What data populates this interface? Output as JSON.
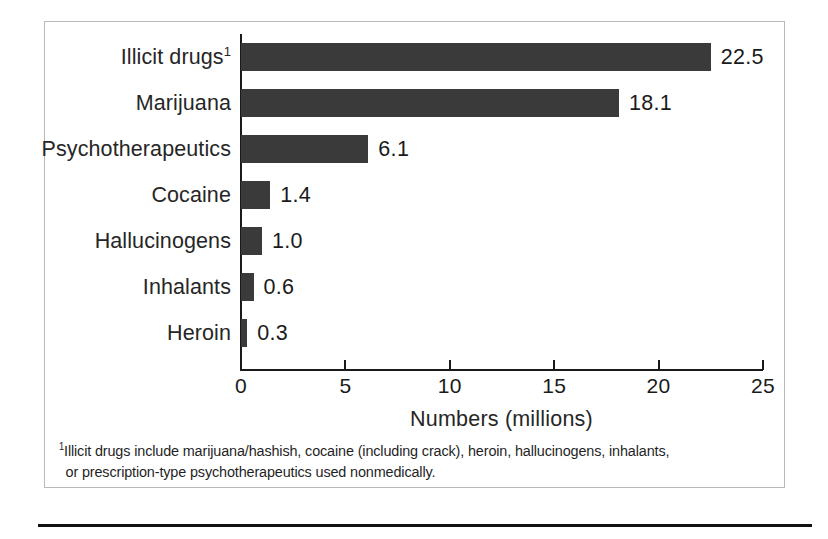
{
  "chart_data": {
    "type": "bar",
    "orientation": "horizontal",
    "title": "",
    "xlabel": "Numbers (millions)",
    "ylabel": "",
    "xlim": [
      0,
      25
    ],
    "xticks": [
      0,
      5,
      10,
      15,
      20,
      25
    ],
    "xtick_labels": [
      "0",
      "5",
      "10",
      "15",
      "20",
      "25"
    ],
    "grid": false,
    "legend": null,
    "bar_color": "#3a3a3a",
    "categories": [
      "Illicit drugs",
      "Marijuana",
      "Psychotherapeutics",
      "Cocaine",
      "Hallucinogens",
      "Inhalants",
      "Heroin"
    ],
    "values": [
      22.5,
      18.1,
      6.1,
      1.4,
      1.0,
      0.6,
      0.3
    ],
    "bars": [
      {
        "label": "Illicit drugs",
        "footnote_marker": "1",
        "value": 22.5,
        "value_label": "22.5"
      },
      {
        "label": "Marijuana",
        "footnote_marker": "",
        "value": 18.1,
        "value_label": "18.1"
      },
      {
        "label": "Psychotherapeutics",
        "footnote_marker": "",
        "value": 6.1,
        "value_label": "6.1"
      },
      {
        "label": "Cocaine",
        "footnote_marker": "",
        "value": 1.4,
        "value_label": "1.4"
      },
      {
        "label": "Hallucinogens",
        "footnote_marker": "",
        "value": 1.0,
        "value_label": "1.0"
      },
      {
        "label": "Inhalants",
        "footnote_marker": "",
        "value": 0.6,
        "value_label": "0.6"
      },
      {
        "label": "Heroin",
        "footnote_marker": "",
        "value": 0.3,
        "value_label": "0.3"
      }
    ]
  },
  "footnote": {
    "marker": "1",
    "line1": "Illicit drugs include marijuana/hashish, cocaine (including crack), heroin, hallucinogens, inhalants,",
    "line2": "or prescription-type psychotherapeutics used nonmedically."
  }
}
